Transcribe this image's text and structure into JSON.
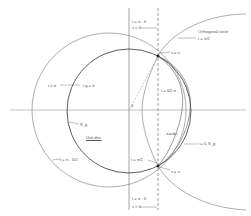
{
  "diagram": {
    "type": "geometric construction",
    "colors": {
      "line": "#444444",
      "light_line": "#888888",
      "background": "#ffffff"
    },
    "labels": {
      "top_t": "t = ∞ - θ",
      "top_s": "s < 0",
      "orthogonal_circle": "Orthogonal circle",
      "t_pi_half_top": "t = π/2",
      "s_inf_top": "s = ∞",
      "t_theta_half_pi": "t = θ/2 π",
      "t_pi_left": "t ≠ π",
      "t_g_pi": "t g = π",
      "origin": "0",
      "s_g_left": "S_g",
      "unit_disc": "Unit disc",
      "t_pi_theta_half": "t = π - θ/2",
      "t_theta": "t = θ",
      "t_zero_sg": "t = 0, S_g",
      "t_pi_half_bottom": "t = π/2",
      "s_inf_bottom": "s = ∞",
      "bottom_t": "t = π - θ",
      "bottom_s": "s > 0"
    }
  }
}
